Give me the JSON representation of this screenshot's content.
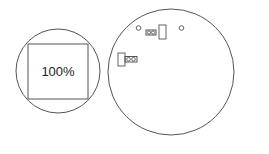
{
  "diagram": {
    "left_circle": {
      "square_label": "100%"
    },
    "colors": {
      "stroke": "#555555",
      "background": "#ffffff",
      "text": "#222222"
    }
  }
}
